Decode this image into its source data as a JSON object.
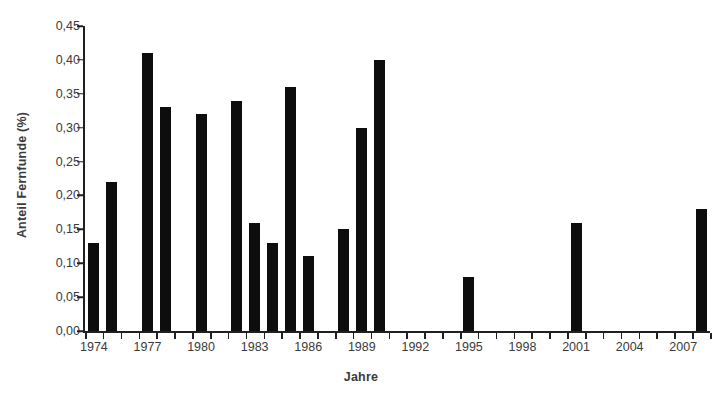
{
  "chart_data": {
    "type": "bar",
    "title": "",
    "xlabel": "Jahre",
    "ylabel": "Anteil Fernfunde (%)",
    "categories": [
      1974,
      1975,
      1976,
      1977,
      1978,
      1979,
      1980,
      1981,
      1982,
      1983,
      1984,
      1985,
      1986,
      1987,
      1988,
      1989,
      1990,
      1991,
      1992,
      1993,
      1994,
      1995,
      1996,
      1997,
      1998,
      1999,
      2000,
      2001,
      2002,
      2003,
      2004,
      2005,
      2006,
      2007,
      2008
    ],
    "values": [
      0.13,
      0.22,
      0.0,
      0.41,
      0.33,
      0.0,
      0.32,
      0.0,
      0.34,
      0.16,
      0.13,
      0.36,
      0.11,
      0.0,
      0.15,
      0.3,
      0.4,
      0.0,
      0.0,
      0.0,
      0.0,
      0.08,
      0.0,
      0.0,
      0.0,
      0.0,
      0.0,
      0.16,
      0.0,
      0.0,
      0.0,
      0.0,
      0.0,
      0.0,
      0.18
    ],
    "ylim": [
      0.0,
      0.45
    ],
    "ytick_values": [
      0.0,
      0.05,
      0.1,
      0.15,
      0.2,
      0.25,
      0.3,
      0.35,
      0.4,
      0.45
    ],
    "ytick_labels": [
      "0,00",
      "0,05",
      "0,10",
      "0,15",
      "0,20",
      "0,25",
      "0,30",
      "0,35",
      "0,40",
      "0,45"
    ],
    "xtick_labeled_years": [
      1974,
      1977,
      1980,
      1983,
      1986,
      1989,
      1992,
      1995,
      1998,
      2001,
      2004,
      2007
    ],
    "xtick_labels": [
      "1974",
      "1977",
      "1980",
      "1983",
      "1986",
      "1989",
      "1992",
      "1995",
      "1998",
      "2001",
      "2004",
      "2007"
    ],
    "grid": false,
    "legend": null,
    "bar_color": "#0d0d0d",
    "axis_color": "#231f20",
    "text_color": "#3b3b3b",
    "background": "#ffffff"
  }
}
